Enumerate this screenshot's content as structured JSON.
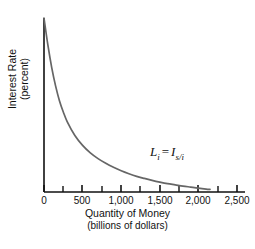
{
  "chart_data": {
    "type": "line",
    "title": "",
    "subtitle": "",
    "xlabel": "Quantity of Money",
    "xlabel_sub": "(billions of dollars)",
    "ylabel": "Interest Rate",
    "ylabel_sub": "(percent)",
    "xlim": [
      0,
      2500
    ],
    "ylim": [
      0,
      10
    ],
    "grid": false,
    "legend_position": "inline-annotation",
    "x_ticks_major": [
      0,
      500,
      1000,
      1500,
      2000,
      2500
    ],
    "x_tick_labels": [
      "0",
      "500",
      "1,000",
      "1,500",
      "2,000",
      "2,500"
    ],
    "x_ticks_minor": [
      250,
      750,
      1250,
      1750,
      2250
    ],
    "y_ticks": [],
    "y_tick_labels": [],
    "series": [
      {
        "name": "L_i = I_s/i",
        "annotation_label": "L",
        "annotation_sub1": "i",
        "annotation_eq": "=",
        "annotation_label2": "I",
        "annotation_sub2": "s/i",
        "color": "#666666",
        "x": [
          0,
          50,
          100,
          150,
          200,
          250,
          300,
          400,
          500,
          600,
          700,
          800,
          900,
          1000,
          1100,
          1200,
          1300,
          1400,
          1500,
          1600,
          1700,
          1800,
          1900,
          2000,
          2100,
          2150
        ],
        "y": [
          10.0,
          8.45,
          7.15,
          6.1,
          5.25,
          4.6,
          4.05,
          3.25,
          2.68,
          2.25,
          1.92,
          1.65,
          1.42,
          1.22,
          1.05,
          0.9,
          0.78,
          0.67,
          0.57,
          0.48,
          0.41,
          0.34,
          0.28,
          0.22,
          0.17,
          0.15
        ]
      }
    ]
  },
  "axes": {
    "axis_color": "#111111",
    "curve_color": "#666666"
  }
}
